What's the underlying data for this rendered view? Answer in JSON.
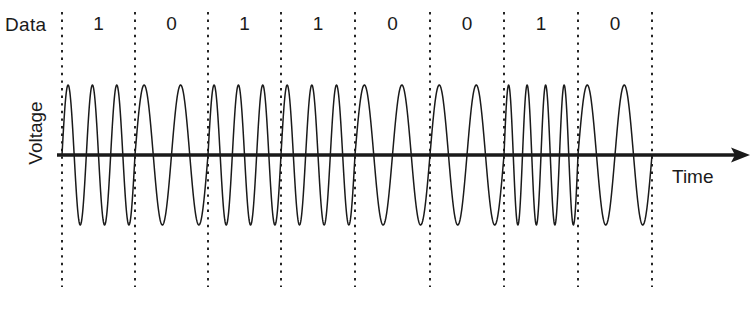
{
  "figure": {
    "type": "fsk-modulation-waveform",
    "title": "",
    "background_color": "#ffffff",
    "line_color": "#1a1a1a"
  },
  "labels": {
    "data": "Data",
    "voltage": "Voltage",
    "time": "Time"
  },
  "axis": {
    "baseline_y": 155,
    "x_start": 62,
    "x_end": 750,
    "arrow_icon": "arrow-right-icon"
  },
  "chart_data": {
    "type": "line",
    "title": "",
    "xlabel": "Time",
    "ylabel": "Voltage",
    "bits": [
      "1",
      "0",
      "1",
      "1",
      "0",
      "0",
      "1",
      "0"
    ],
    "cycles_per_bit": [
      3,
      2,
      3,
      3,
      2,
      2,
      4,
      2
    ],
    "bit_boundaries_x": [
      62,
      135,
      208,
      281,
      355,
      430,
      504,
      578,
      652
    ],
    "bit_width_px": 73.75,
    "amplitude_px": 70,
    "baseline_y": 155,
    "grid": false,
    "legend": "none",
    "xlim": [
      62,
      652
    ],
    "ylim": [
      -1,
      1
    ]
  },
  "separators": {
    "count": 9,
    "style": "dotted",
    "top_y": 12,
    "bottom_y": 287,
    "x_positions": [
      62,
      135,
      208,
      281,
      355,
      430,
      504,
      578,
      652
    ]
  }
}
